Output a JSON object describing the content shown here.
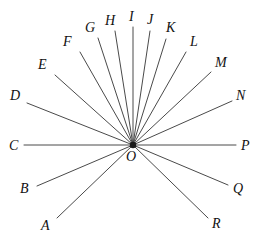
{
  "figure": {
    "kind": "geometry-ray-diagram",
    "stroke_color": "#4a4a4a",
    "label_color": "#111111",
    "background_color": "#ffffff",
    "vertex": {
      "name": "O",
      "label": "O",
      "x": 133,
      "y": 145,
      "label_x": 126,
      "label_y": 150
    },
    "rays": [
      {
        "label": "A",
        "end_x": 57,
        "end_y": 218,
        "label_x": 41,
        "label_y": 219
      },
      {
        "label": "B",
        "end_x": 37,
        "end_y": 186,
        "label_x": 20,
        "label_y": 182
      },
      {
        "label": "C",
        "end_x": 24,
        "end_y": 145,
        "label_x": 9,
        "label_y": 139
      },
      {
        "label": "D",
        "end_x": 27,
        "end_y": 103,
        "label_x": 10,
        "label_y": 89
      },
      {
        "label": "E",
        "end_x": 55,
        "end_y": 75,
        "label_x": 38,
        "label_y": 58
      },
      {
        "label": "F",
        "end_x": 80,
        "end_y": 52,
        "label_x": 63,
        "label_y": 35
      },
      {
        "label": "G",
        "end_x": 98,
        "end_y": 38,
        "label_x": 85,
        "label_y": 21
      },
      {
        "label": "H",
        "end_x": 115,
        "end_y": 31,
        "label_x": 105,
        "label_y": 14
      },
      {
        "label": "I",
        "end_x": 133,
        "end_y": 27,
        "label_x": 129,
        "label_y": 10
      },
      {
        "label": "J",
        "end_x": 150,
        "end_y": 31,
        "label_x": 147,
        "label_y": 13
      },
      {
        "label": "K",
        "end_x": 166,
        "end_y": 39,
        "label_x": 166,
        "label_y": 21
      },
      {
        "label": "L",
        "end_x": 186,
        "end_y": 52,
        "label_x": 190,
        "label_y": 35
      },
      {
        "label": "M",
        "end_x": 211,
        "end_y": 72,
        "label_x": 215,
        "label_y": 56
      },
      {
        "label": "N",
        "end_x": 232,
        "end_y": 101,
        "label_x": 236,
        "label_y": 89
      },
      {
        "label": "P",
        "end_x": 236,
        "end_y": 145,
        "label_x": 241,
        "label_y": 139
      },
      {
        "label": "Q",
        "end_x": 228,
        "end_y": 185,
        "label_x": 233,
        "label_y": 182
      },
      {
        "label": "R",
        "end_x": 208,
        "end_y": 218,
        "label_x": 212,
        "label_y": 217
      }
    ]
  }
}
